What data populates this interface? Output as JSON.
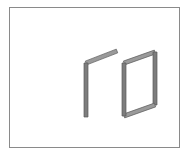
{
  "figure": {
    "title": "",
    "caption": "",
    "background_color": "#ffffff",
    "border_color": "#8a8a8a",
    "stroke_color": "#6e6e6e",
    "stroke_dark_color": "#5a5a5a",
    "fill_color": "#7d7d7d",
    "fill_light_color": "#9a9a9a",
    "frame": {
      "x": 9,
      "y": 7,
      "width": 171,
      "height": 141,
      "border_width": 1
    },
    "shapes": [
      {
        "name": "bent-bar-left",
        "label": "L-shaped bent bar",
        "type": "open-polyline-bar",
        "description": "Vertical bar with a diagonal arm bending up and to the right",
        "vertices": [
          {
            "x": 117,
            "y": 51
          },
          {
            "x": 86,
            "y": 63
          },
          {
            "x": 86,
            "y": 117
          }
        ],
        "bar_thickness": 4
      },
      {
        "name": "quad-frame-right",
        "label": "Closed quadrilateral frame",
        "type": "closed-quadrilateral-bar",
        "description": "Four-sided frame drawn in perspective as a parallelogram outline",
        "vertices": [
          {
            "x": 124,
            "y": 63
          },
          {
            "x": 155,
            "y": 52
          },
          {
            "x": 155,
            "y": 105
          },
          {
            "x": 124,
            "y": 116
          }
        ],
        "bar_thickness": 4
      }
    ]
  }
}
